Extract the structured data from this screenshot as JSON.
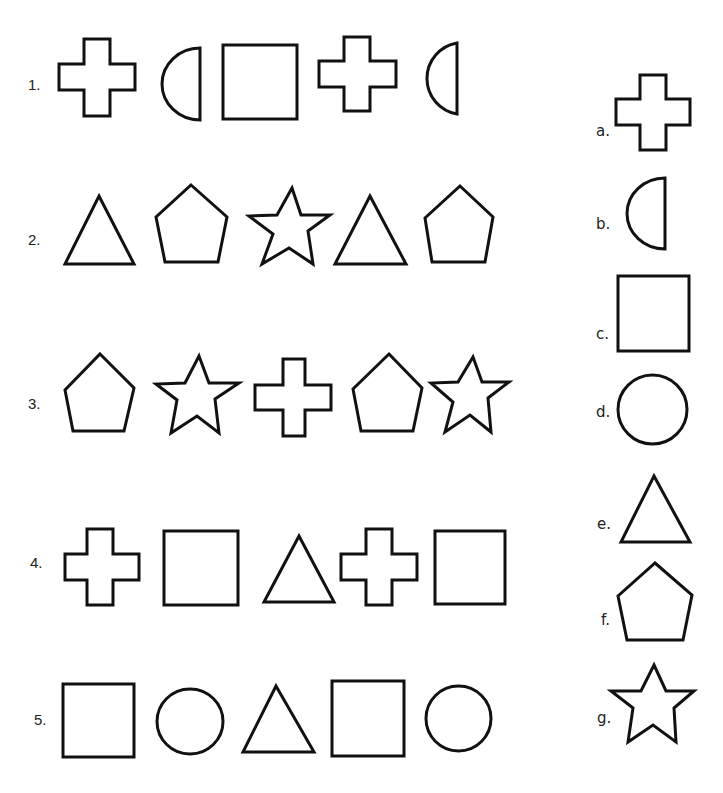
{
  "worksheet": {
    "colors": {
      "ink": "#111111",
      "paper": "#ffffff"
    },
    "rows": [
      {
        "label": "1.",
        "shapes": [
          "cross",
          "half-circle",
          "square",
          "cross",
          "half-circle"
        ]
      },
      {
        "label": "2.",
        "shapes": [
          "triangle",
          "pentagon",
          "star",
          "triangle",
          "pentagon"
        ]
      },
      {
        "label": "3.",
        "shapes": [
          "pentagon",
          "star",
          "cross",
          "pentagon",
          "star"
        ]
      },
      {
        "label": "4.",
        "shapes": [
          "cross",
          "square",
          "triangle",
          "cross",
          "square"
        ]
      },
      {
        "label": "5.",
        "shapes": [
          "square",
          "circle",
          "triangle",
          "square",
          "circle"
        ]
      }
    ],
    "answer_key": [
      {
        "label": "a.",
        "shape": "cross"
      },
      {
        "label": "b.",
        "shape": "half-circle"
      },
      {
        "label": "c.",
        "shape": "square"
      },
      {
        "label": "d.",
        "shape": "circle"
      },
      {
        "label": "e.",
        "shape": "triangle"
      },
      {
        "label": "f.",
        "shape": "pentagon"
      },
      {
        "label": "g.",
        "shape": "star"
      }
    ]
  }
}
